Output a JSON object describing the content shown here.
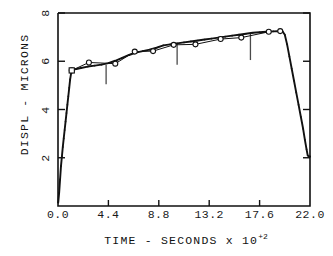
{
  "chart_data": {
    "type": "line",
    "title": "",
    "xlabel": "TIME - SECONDS x 10",
    "xlabel_exponent": "+2",
    "ylabel": "DISPL - MICRONS",
    "xlim": [
      0.0,
      22.0
    ],
    "ylim": [
      0.0,
      8.0
    ],
    "xticks": [
      "0.0",
      "4.4",
      "8.8",
      "13.2",
      "17.6",
      "22.0"
    ],
    "xtick_values": [
      0.0,
      4.4,
      8.8,
      13.2,
      17.6,
      22.0
    ],
    "yticks": [
      "2",
      "4",
      "6",
      "8"
    ],
    "ytick_values": [
      2,
      4,
      6,
      8
    ],
    "grid": false,
    "legend": "none",
    "series": [
      {
        "name": "measured-curve",
        "marker": "dot",
        "points": [
          [
            0.02,
            0.15
          ],
          [
            0.1,
            0.55
          ],
          [
            0.18,
            1.1
          ],
          [
            0.26,
            1.65
          ],
          [
            0.34,
            2.05
          ],
          [
            0.42,
            2.45
          ],
          [
            0.5,
            2.8
          ],
          [
            0.58,
            3.15
          ],
          [
            0.66,
            3.5
          ],
          [
            0.74,
            3.85
          ],
          [
            0.82,
            4.2
          ],
          [
            0.9,
            4.55
          ],
          [
            0.98,
            4.9
          ],
          [
            1.06,
            5.25
          ],
          [
            1.16,
            5.55
          ],
          [
            1.3,
            5.65
          ],
          [
            1.6,
            5.68
          ],
          [
            2.0,
            5.72
          ],
          [
            2.6,
            5.78
          ],
          [
            3.2,
            5.82
          ],
          [
            3.8,
            5.86
          ],
          [
            4.4,
            5.92
          ],
          [
            5.0,
            6.02
          ],
          [
            5.6,
            6.14
          ],
          [
            6.2,
            6.26
          ],
          [
            6.8,
            6.36
          ],
          [
            7.4,
            6.42
          ],
          [
            8.0,
            6.48
          ],
          [
            8.6,
            6.56
          ],
          [
            9.2,
            6.66
          ],
          [
            9.8,
            6.7
          ],
          [
            10.4,
            6.74
          ],
          [
            11.0,
            6.78
          ],
          [
            11.6,
            6.82
          ],
          [
            12.2,
            6.86
          ],
          [
            12.8,
            6.9
          ],
          [
            13.4,
            6.94
          ],
          [
            14.0,
            6.98
          ],
          [
            14.6,
            7.02
          ],
          [
            15.2,
            7.06
          ],
          [
            15.8,
            7.1
          ],
          [
            16.4,
            7.14
          ],
          [
            17.0,
            7.18
          ],
          [
            17.6,
            7.2
          ],
          [
            18.2,
            7.22
          ],
          [
            18.8,
            7.24
          ],
          [
            19.3,
            7.25
          ],
          [
            19.6,
            7.24
          ],
          [
            19.8,
            7.1
          ],
          [
            20.0,
            6.7
          ],
          [
            20.2,
            6.2
          ],
          [
            20.4,
            5.7
          ],
          [
            20.6,
            5.2
          ],
          [
            20.8,
            4.7
          ],
          [
            21.0,
            4.2
          ],
          [
            21.2,
            3.7
          ],
          [
            21.4,
            3.2
          ],
          [
            21.55,
            2.75
          ],
          [
            21.7,
            2.35
          ],
          [
            21.8,
            2.1
          ],
          [
            21.9,
            2.05
          ],
          [
            22.0,
            2.05
          ]
        ]
      },
      {
        "name": "model-curve",
        "marker": "circle",
        "points": [
          [
            1.2,
            5.62
          ],
          [
            2.7,
            5.95
          ],
          [
            5.0,
            5.9
          ],
          [
            6.7,
            6.4
          ],
          [
            8.3,
            6.42
          ],
          [
            10.1,
            6.68
          ],
          [
            12.0,
            6.7
          ],
          [
            14.2,
            6.92
          ],
          [
            16.0,
            6.98
          ],
          [
            18.4,
            7.22
          ],
          [
            19.4,
            7.25
          ]
        ]
      }
    ],
    "markers": [
      {
        "name": "square-marker",
        "x": 1.2,
        "y": 5.62
      }
    ],
    "error_bars": [
      {
        "x": 4.2,
        "y_top": 5.85,
        "y_bottom": 5.05
      },
      {
        "x": 10.4,
        "y_top": 6.75,
        "y_bottom": 5.85
      },
      {
        "x": 16.8,
        "y_top": 7.15,
        "y_bottom": 6.05
      }
    ]
  },
  "axes": {
    "y_title": "DISPL - MICRONS",
    "x_title_main": "TIME - SECONDS x 10",
    "x_title_sup": "+2"
  }
}
